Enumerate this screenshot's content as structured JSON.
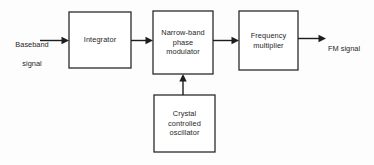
{
  "diagram": {
    "type": "block-diagram",
    "background_color": "#fdfdfd",
    "line_color": "#1d1d1d",
    "text_color": "#262626",
    "blocks": [
      {
        "id": "integrator",
        "label": "Integrator",
        "lines": [
          "Integrator"
        ],
        "x": 69,
        "y": 12,
        "w": 62,
        "h": 56
      },
      {
        "id": "phase-modulator",
        "label": "Narrow-band phase modulator",
        "lines": [
          "Narrow-band",
          "phase",
          "modulator"
        ],
        "x": 153,
        "y": 11,
        "w": 60,
        "h": 63
      },
      {
        "id": "frequency-multiplier",
        "label": "Frequency multiplier",
        "lines": [
          "Frequency",
          "multiplier"
        ],
        "x": 239,
        "y": 11,
        "w": 59,
        "h": 59
      },
      {
        "id": "crystal-oscillator",
        "label": "Crystal controlled oscillator",
        "lines": [
          "Crystal",
          "controlled",
          "oscillator"
        ],
        "x": 154,
        "y": 95,
        "w": 61,
        "h": 57
      }
    ],
    "io_labels": [
      {
        "id": "baseband-signal",
        "lines": [
          "Baseband",
          "signal"
        ],
        "x": 6,
        "y": 30,
        "w": 52
      },
      {
        "id": "fm-signal",
        "lines": [
          "FM signal"
        ],
        "x": 328,
        "y": 34,
        "w": 44
      }
    ],
    "connections": [
      {
        "id": "baseband-to-integrator",
        "from": "baseband-signal",
        "to": "integrator",
        "orientation": "horizontal"
      },
      {
        "id": "integrator-to-modulator",
        "from": "integrator",
        "to": "phase-modulator",
        "orientation": "horizontal"
      },
      {
        "id": "modulator-to-multiplier",
        "from": "phase-modulator",
        "to": "frequency-multiplier",
        "orientation": "horizontal"
      },
      {
        "id": "multiplier-to-fm-output",
        "from": "frequency-multiplier",
        "to": "fm-signal",
        "orientation": "horizontal"
      },
      {
        "id": "oscillator-to-modulator",
        "from": "crystal-oscillator",
        "to": "phase-modulator",
        "orientation": "vertical"
      }
    ]
  }
}
